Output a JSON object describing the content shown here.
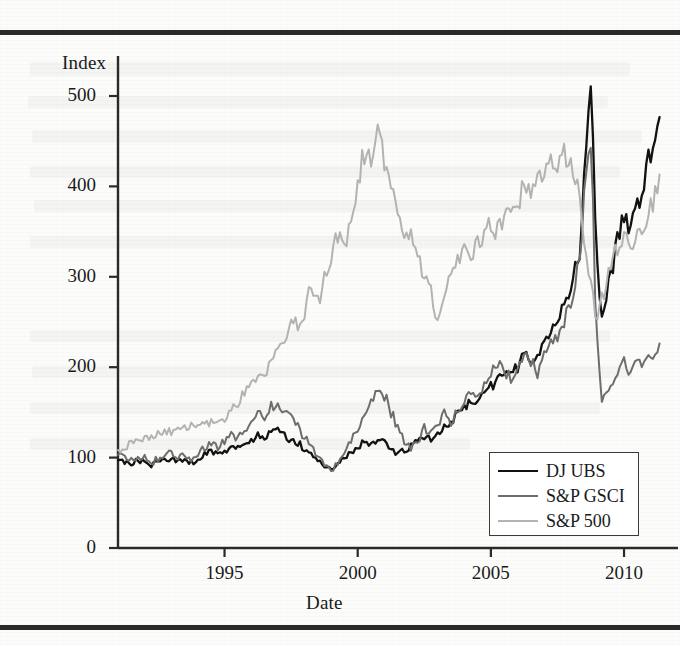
{
  "figure": {
    "rules": {
      "top_label": "top-rule",
      "bottom_label": "bottom-rule"
    }
  },
  "chart_data": {
    "type": "line",
    "title": "",
    "xlabel": "Date",
    "ylabel": "Index",
    "xlim": [
      1991.0,
      2011.35
    ],
    "ylim": [
      0,
      520
    ],
    "yticks": [
      0,
      100,
      200,
      300,
      400,
      500
    ],
    "ytick_labels": [
      "0",
      "100",
      "200",
      "300",
      "400",
      "500"
    ],
    "xticks": [
      1995,
      2000,
      2005,
      2010
    ],
    "xtick_labels": [
      "1995",
      "2000",
      "2005",
      "2010"
    ],
    "grid": false,
    "legend_position": "lower-right",
    "legend_entries": [
      "DJ UBS",
      "S&P GSCI",
      "S&P 500"
    ],
    "colors": {
      "dj_ubs": "#121212",
      "sp_gsci": "#6e6e6e",
      "sp_500": "#b3b3b3",
      "axis": "#2a2a2a",
      "text": "#1a1a1a"
    },
    "series": [
      {
        "name": "DJ UBS",
        "color": "#121212",
        "x": [
          1991.0,
          1991.25,
          1991.5,
          1991.75,
          1992.0,
          1992.25,
          1992.5,
          1992.75,
          1993.0,
          1993.25,
          1993.5,
          1993.75,
          1994.0,
          1994.25,
          1994.5,
          1994.75,
          1995.0,
          1995.25,
          1995.5,
          1995.75,
          1996.0,
          1996.25,
          1996.5,
          1996.75,
          1997.0,
          1997.25,
          1997.5,
          1997.75,
          1998.0,
          1998.25,
          1998.5,
          1998.75,
          1999.0,
          1999.25,
          1999.5,
          1999.75,
          2000.0,
          2000.25,
          2000.5,
          2000.75,
          2001.0,
          2001.25,
          2001.5,
          2001.75,
          2002.0,
          2002.25,
          2002.5,
          2002.75,
          2003.0,
          2003.25,
          2003.5,
          2003.75,
          2004.0,
          2004.25,
          2004.5,
          2004.75,
          2005.0,
          2005.25,
          2005.5,
          2005.75,
          2006.0,
          2006.25,
          2006.5,
          2006.75,
          2007.0,
          2007.25,
          2007.5,
          2007.75,
          2008.0,
          2008.35,
          2008.5,
          2008.75,
          2009.0,
          2009.15,
          2009.5,
          2009.75,
          2010.0,
          2010.25,
          2010.5,
          2010.75,
          2011.0,
          2011.35
        ],
        "y": [
          100,
          96,
          93,
          97,
          95,
          92,
          95,
          97,
          99,
          96,
          98,
          95,
          97,
          103,
          106,
          104,
          108,
          112,
          110,
          114,
          118,
          124,
          120,
          127,
          131,
          124,
          120,
          116,
          110,
          104,
          98,
          92,
          86,
          92,
          100,
          105,
          112,
          118,
          115,
          120,
          116,
          110,
          104,
          108,
          112,
          118,
          124,
          121,
          126,
          133,
          140,
          148,
          156,
          164,
          160,
          170,
          178,
          188,
          196,
          190,
          200,
          212,
          206,
          218,
          228,
          240,
          252,
          268,
          290,
          330,
          415,
          500,
          310,
          250,
          300,
          340,
          368,
          352,
          380,
          404,
          440,
          490
        ]
      },
      {
        "name": "S&P GSCI",
        "color": "#6e6e6e",
        "x": [
          1991.0,
          1991.25,
          1991.5,
          1991.75,
          1992.0,
          1992.25,
          1992.5,
          1992.75,
          1993.0,
          1993.25,
          1993.5,
          1993.75,
          1994.0,
          1994.25,
          1994.5,
          1994.75,
          1995.0,
          1995.25,
          1995.5,
          1995.75,
          1996.0,
          1996.25,
          1996.5,
          1996.75,
          1997.0,
          1997.25,
          1997.5,
          1997.75,
          1998.0,
          1998.25,
          1998.5,
          1998.75,
          1999.0,
          1999.25,
          1999.5,
          1999.75,
          2000.0,
          2000.25,
          2000.5,
          2000.75,
          2001.0,
          2001.25,
          2001.5,
          2001.75,
          2002.0,
          2002.25,
          2002.5,
          2002.75,
          2003.0,
          2003.25,
          2003.5,
          2003.75,
          2004.0,
          2004.25,
          2004.5,
          2004.75,
          2005.0,
          2005.25,
          2005.5,
          2005.75,
          2006.0,
          2006.25,
          2006.5,
          2006.75,
          2007.0,
          2007.25,
          2007.5,
          2007.75,
          2008.0,
          2008.35,
          2008.5,
          2008.75,
          2009.0,
          2009.15,
          2009.5,
          2009.75,
          2010.0,
          2010.25,
          2010.5,
          2010.75,
          2011.0,
          2011.35
        ],
        "y": [
          105,
          100,
          96,
          102,
          99,
          95,
          99,
          102,
          105,
          100,
          103,
          99,
          102,
          110,
          114,
          112,
          118,
          126,
          122,
          130,
          138,
          150,
          142,
          156,
          163,
          150,
          142,
          134,
          124,
          114,
          104,
          94,
          84,
          94,
          106,
          118,
          132,
          148,
          160,
          178,
          168,
          150,
          134,
          118,
          112,
          120,
          132,
          126,
          134,
          148,
          140,
          152,
          160,
          172,
          164,
          180,
          192,
          206,
          196,
          186,
          200,
          218,
          206,
          196,
          210,
          222,
          232,
          250,
          270,
          320,
          390,
          430,
          230,
          160,
          180,
          195,
          205,
          190,
          205,
          200,
          212,
          225
        ]
      },
      {
        "name": "S&P 500",
        "color": "#b3b3b3",
        "x": [
          1991.0,
          1991.25,
          1991.5,
          1991.75,
          1992.0,
          1992.25,
          1992.5,
          1992.75,
          1993.0,
          1993.25,
          1993.5,
          1993.75,
          1994.0,
          1994.25,
          1994.5,
          1994.75,
          1995.0,
          1995.25,
          1995.5,
          1995.75,
          1996.0,
          1996.25,
          1996.5,
          1996.75,
          1997.0,
          1997.25,
          1997.5,
          1997.75,
          1998.0,
          1998.25,
          1998.5,
          1998.75,
          1999.0,
          1999.25,
          1999.5,
          1999.75,
          2000.0,
          2000.2,
          2000.5,
          2000.75,
          2001.0,
          2001.25,
          2001.5,
          2001.75,
          2002.0,
          2002.25,
          2002.5,
          2002.75,
          2003.0,
          2003.25,
          2003.5,
          2003.75,
          2004.0,
          2004.25,
          2004.5,
          2004.75,
          2005.0,
          2005.25,
          2005.5,
          2005.75,
          2006.0,
          2006.25,
          2006.5,
          2006.75,
          2007.0,
          2007.25,
          2007.5,
          2007.75,
          2008.0,
          2008.35,
          2008.5,
          2008.75,
          2009.0,
          2009.15,
          2009.5,
          2009.75,
          2010.0,
          2010.25,
          2010.5,
          2010.75,
          2011.0,
          2011.35
        ],
        "y": [
          108,
          112,
          116,
          122,
          120,
          124,
          126,
          130,
          128,
          132,
          134,
          136,
          134,
          136,
          138,
          136,
          140,
          152,
          160,
          172,
          180,
          192,
          188,
          204,
          218,
          234,
          252,
          248,
          262,
          288,
          272,
          300,
          322,
          344,
          336,
          372,
          400,
          440,
          425,
          458,
          430,
          400,
          372,
          340,
          352,
          330,
          296,
          282,
          256,
          272,
          300,
          316,
          330,
          322,
          336,
          350,
          356,
          350,
          364,
          378,
          386,
          396,
          388,
          404,
          420,
          432,
          424,
          440,
          420,
          390,
          330,
          290,
          252,
          278,
          310,
          330,
          344,
          332,
          348,
          362,
          380,
          400
        ]
      }
    ]
  },
  "plot_geometry": {
    "left_px": 118,
    "right_px": 660,
    "top_px": 60,
    "bottom_px": 548,
    "y0_px": 548,
    "y500_px": 96
  },
  "legend": {
    "items": [
      {
        "label": "DJ UBS",
        "color": "#121212",
        "line_width": 2.6
      },
      {
        "label": "S&P GSCI",
        "color": "#6e6e6e",
        "line_width": 2.2
      },
      {
        "label": "S&P 500",
        "color": "#b3b3b3",
        "line_width": 2.2
      }
    ]
  }
}
